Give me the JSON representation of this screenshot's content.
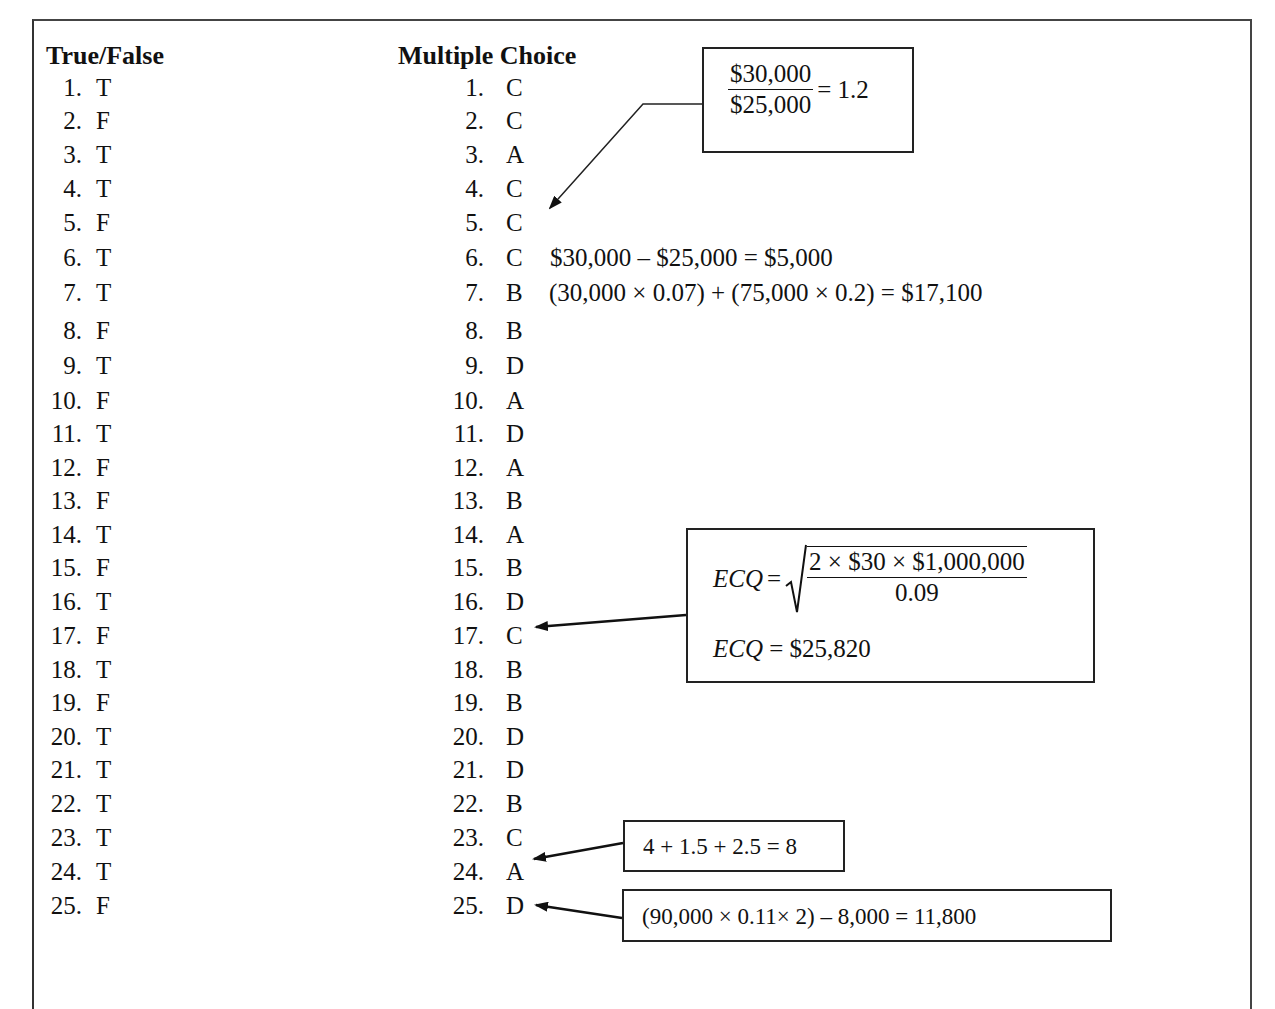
{
  "true_false": {
    "heading": "True/False",
    "items": [
      {
        "n": "1.",
        "a": "T"
      },
      {
        "n": "2.",
        "a": "F"
      },
      {
        "n": "3.",
        "a": "T"
      },
      {
        "n": "4.",
        "a": "T"
      },
      {
        "n": "5.",
        "a": "F"
      },
      {
        "n": "6.",
        "a": "T"
      },
      {
        "n": "7.",
        "a": "T"
      },
      {
        "n": "8.",
        "a": "F"
      },
      {
        "n": "9.",
        "a": "T"
      },
      {
        "n": "10.",
        "a": "F"
      },
      {
        "n": "11.",
        "a": "T"
      },
      {
        "n": "12.",
        "a": "F"
      },
      {
        "n": "13.",
        "a": "F"
      },
      {
        "n": "14.",
        "a": "T"
      },
      {
        "n": "15.",
        "a": "F"
      },
      {
        "n": "16.",
        "a": "T"
      },
      {
        "n": "17.",
        "a": "F"
      },
      {
        "n": "18.",
        "a": "T"
      },
      {
        "n": "19.",
        "a": "F"
      },
      {
        "n": "20.",
        "a": "T"
      },
      {
        "n": "21.",
        "a": "T"
      },
      {
        "n": "22.",
        "a": "T"
      },
      {
        "n": "23.",
        "a": "T"
      },
      {
        "n": "24.",
        "a": "T"
      },
      {
        "n": "25.",
        "a": "F"
      }
    ]
  },
  "multiple_choice": {
    "heading": "Multiple Choice",
    "items": [
      {
        "n": "1.",
        "a": "C"
      },
      {
        "n": "2.",
        "a": "C"
      },
      {
        "n": "3.",
        "a": "A"
      },
      {
        "n": "4.",
        "a": "C"
      },
      {
        "n": "5.",
        "a": "C"
      },
      {
        "n": "6.",
        "a": "C"
      },
      {
        "n": "7.",
        "a": "B"
      },
      {
        "n": "8.",
        "a": "B"
      },
      {
        "n": "9.",
        "a": "D"
      },
      {
        "n": "10.",
        "a": "A"
      },
      {
        "n": "11.",
        "a": "D"
      },
      {
        "n": "12.",
        "a": "A"
      },
      {
        "n": "13.",
        "a": "B"
      },
      {
        "n": "14.",
        "a": "A"
      },
      {
        "n": "15.",
        "a": "B"
      },
      {
        "n": "16.",
        "a": "D"
      },
      {
        "n": "17.",
        "a": "C"
      },
      {
        "n": "18.",
        "a": "B"
      },
      {
        "n": "19.",
        "a": "B"
      },
      {
        "n": "20.",
        "a": "D"
      },
      {
        "n": "21.",
        "a": "D"
      },
      {
        "n": "22.",
        "a": "B"
      },
      {
        "n": "23.",
        "a": "C"
      },
      {
        "n": "24.",
        "a": "A"
      },
      {
        "n": "25.",
        "a": "D"
      }
    ]
  },
  "annotations": {
    "q5_ratio": {
      "numerator": "$30,000",
      "denominator": "$25,000",
      "result": "= 1.2"
    },
    "q6_eq": "$30,000 – $25,000 = $5,000",
    "q7_eq": "(30,000 × 0.07) + (75,000 × 0.2) = $17,100",
    "q17_ecq": {
      "label": "ECQ",
      "equals": "=",
      "radicand_numerator": "2 × $30 × $1,000,000",
      "radicand_denominator": "0.09",
      "result_label": "ECQ",
      "result_value": "= $25,820"
    },
    "q24_eq": "4 + 1.5 + 2.5 = 8",
    "q25_eq": "(90,000 × 0.11× 2) – 8,000 = 11,800"
  }
}
